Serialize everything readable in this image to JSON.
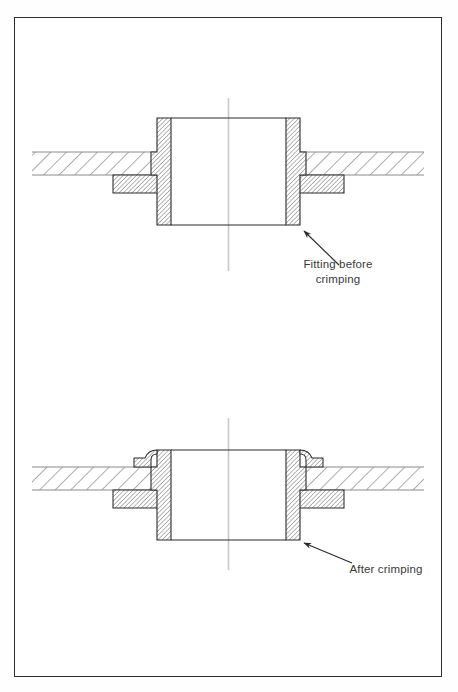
{
  "figure": {
    "type": "engineering-cross-section-diagram",
    "border_color": "#2e2e2e",
    "background_color": "#ffffff",
    "line_color": "#2a2a2a",
    "hatch_color": "#3a3a3a",
    "centerline_color": "#c9c9c9",
    "text_color": "#3a3a3a"
  },
  "views": [
    {
      "id": "upper",
      "name": "fitting-before-crimping",
      "callout": {
        "label_line1": "Fitting before",
        "label_line2": "crimping",
        "label_full": "Fitting before crimping"
      },
      "parts": [
        {
          "name": "sheet-metal-panel",
          "hatch": "coarse-45"
        },
        {
          "name": "fitting-body",
          "hatch": "fine-45"
        },
        {
          "name": "fitting-flange",
          "hatch": "fine-45"
        },
        {
          "name": "fitting-collar-straight",
          "state": "uncrimped"
        }
      ],
      "centerline": true
    },
    {
      "id": "lower",
      "name": "after-crimping",
      "callout": {
        "label_line1": "After crimping",
        "label_line2": "",
        "label_full": "After crimping"
      },
      "parts": [
        {
          "name": "sheet-metal-panel",
          "hatch": "coarse-45"
        },
        {
          "name": "fitting-body",
          "hatch": "fine-45"
        },
        {
          "name": "fitting-flange",
          "hatch": "fine-45"
        },
        {
          "name": "fitting-collar-rolled",
          "state": "crimped"
        }
      ],
      "centerline": true
    }
  ],
  "labels": {
    "upper_line1": "Fitting before",
    "upper_line2": "crimping",
    "lower_line1": "After crimping"
  }
}
